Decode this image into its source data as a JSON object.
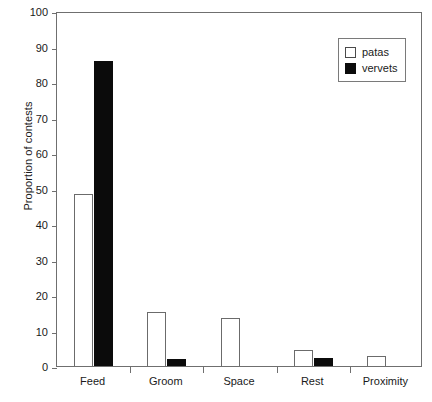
{
  "chart_data": {
    "type": "bar",
    "title": "",
    "subtitle": "",
    "xlabel": "",
    "ylabel": "Proportion of contests",
    "categories": [
      "Feed",
      "Groom",
      "Space",
      "Rest",
      "Proximity"
    ],
    "series": [
      {
        "name": "patas",
        "color": "#ffffff",
        "edgecolor": "#6b6b6b",
        "values": [
          48.5,
          15.3,
          13.4,
          4.5,
          2.8
        ]
      },
      {
        "name": "vervets",
        "color": "#0b0b0b",
        "edgecolor": "#0b0b0b",
        "values": [
          86.0,
          2.0,
          0,
          2.3,
          0
        ]
      }
    ],
    "ylim": [
      0,
      100
    ],
    "ytick_values": [
      0,
      10,
      20,
      30,
      40,
      50,
      60,
      70,
      80,
      90,
      100
    ],
    "ytick_labels": [
      "0",
      "10",
      "20",
      "30",
      "40",
      "50",
      "60",
      "70",
      "80",
      "90",
      "100"
    ],
    "grid": false,
    "frame": true,
    "legend_position": "top-right",
    "legend_entries": [
      "patas",
      "vervets"
    ]
  },
  "axes": {
    "y_title": "Proportion of contests"
  },
  "legend": {
    "entries": [
      {
        "label": "patas"
      },
      {
        "label": "vervets"
      }
    ]
  }
}
